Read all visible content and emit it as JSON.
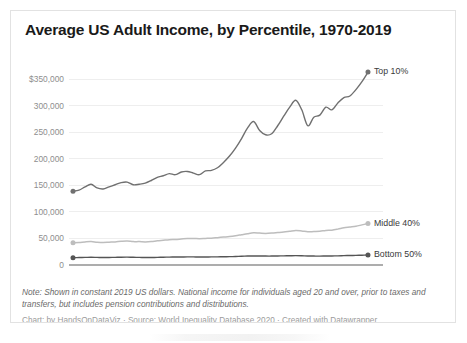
{
  "chart_data": {
    "type": "line",
    "title": "Average US Adult Income, by Percentile, 1970-2019",
    "xlabel": "",
    "ylabel": "",
    "xlim": [
      1970,
      2020
    ],
    "ylim": [
      0,
      350000
    ],
    "grid": true,
    "legend_position": "right-inline",
    "y_ticks": [
      "0",
      "50,000",
      "100,000",
      "150,000",
      "200,000",
      "250,000",
      "300,000",
      "$350,000"
    ],
    "y_tick_values": [
      0,
      50000,
      100000,
      150000,
      200000,
      250000,
      300000,
      350000
    ],
    "x_ticks": [
      "1970",
      "1975",
      "1980",
      "1985",
      "1990",
      "1995",
      "2000",
      "2005",
      "2010",
      "2015",
      "2020"
    ],
    "x_tick_values": [
      1970,
      1975,
      1980,
      1985,
      1990,
      1995,
      2000,
      2005,
      2010,
      2015,
      2020
    ],
    "x": [
      1970,
      1971,
      1972,
      1973,
      1974,
      1975,
      1976,
      1977,
      1978,
      1979,
      1980,
      1981,
      1982,
      1983,
      1984,
      1985,
      1986,
      1987,
      1988,
      1989,
      1990,
      1991,
      1992,
      1993,
      1994,
      1995,
      1996,
      1997,
      1998,
      1999,
      2000,
      2001,
      2002,
      2003,
      2004,
      2005,
      2006,
      2007,
      2008,
      2009,
      2010,
      2011,
      2012,
      2013,
      2014,
      2015,
      2016,
      2017,
      2018,
      2019
    ],
    "series": [
      {
        "name": "Top 10%",
        "color": "#707070",
        "label_color": "#3a3a3a",
        "values": [
          139000,
          141000,
          147000,
          152000,
          145000,
          143000,
          147000,
          151000,
          155000,
          156000,
          151000,
          152000,
          154000,
          159000,
          165000,
          168000,
          172000,
          170000,
          175000,
          176000,
          173000,
          170000,
          177000,
          178000,
          183000,
          193000,
          205000,
          220000,
          238000,
          258000,
          270000,
          253000,
          245000,
          247000,
          262000,
          280000,
          297000,
          310000,
          292000,
          262000,
          278000,
          282000,
          297000,
          292000,
          305000,
          315000,
          318000,
          330000,
          345000,
          363000
        ]
      },
      {
        "name": "Middle 40%",
        "color": "#bdbdbd",
        "label_color": "#3a3a3a",
        "values": [
          42000,
          42500,
          43500,
          44000,
          43000,
          42500,
          43000,
          43500,
          44500,
          45000,
          44000,
          44000,
          43500,
          44000,
          45500,
          46500,
          47500,
          48000,
          49000,
          50000,
          50000,
          49500,
          50000,
          50500,
          51500,
          52500,
          53500,
          55000,
          57000,
          59000,
          60500,
          60000,
          59500,
          60000,
          61000,
          62000,
          63500,
          65000,
          64000,
          62500,
          63000,
          63500,
          65000,
          65500,
          67500,
          70000,
          71500,
          73000,
          75500,
          78000
        ]
      },
      {
        "name": "Bottom 50%",
        "color": "#555555",
        "label_color": "#3a3a3a",
        "values": [
          13800,
          14000,
          14300,
          14600,
          14300,
          14000,
          14200,
          14400,
          14700,
          14800,
          14500,
          14300,
          14000,
          14100,
          14400,
          14600,
          14900,
          15000,
          15100,
          15300,
          15200,
          15000,
          15100,
          15200,
          15300,
          15500,
          15700,
          16000,
          16400,
          16800,
          17000,
          16900,
          16800,
          16800,
          17000,
          17200,
          17400,
          17600,
          17300,
          16900,
          16800,
          16700,
          16900,
          17000,
          17200,
          17600,
          17900,
          18100,
          18400,
          18700
        ]
      }
    ],
    "note": "Note: Shown in constant 2019 US dollars. National income for individuals aged 20 and over, prior to taxes and transfers, but includes pension contributions and distributions.",
    "credit": "Chart: by HandsOnDataViz · Source: World Inequality Database 2020 · Created with Datawrapper"
  }
}
